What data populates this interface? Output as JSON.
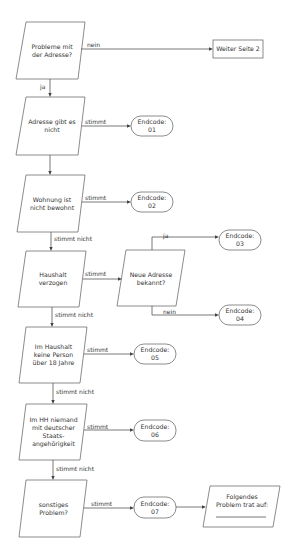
{
  "flowchart": {
    "decisions": [
      {
        "id": "d1",
        "lines": [
          "Probleme mit",
          "der Adresse?"
        ]
      },
      {
        "id": "d2",
        "lines": [
          "Adresse gibt es",
          "nicht"
        ]
      },
      {
        "id": "d3",
        "lines": [
          "Wohnung ist",
          "nicht bewohnt"
        ]
      },
      {
        "id": "d4",
        "lines": [
          "Haushalt",
          "verzogen"
        ]
      },
      {
        "id": "d5",
        "lines": [
          "Neue Adresse",
          "bekannt?"
        ]
      },
      {
        "id": "d6",
        "lines": [
          "Im Haushalt",
          "keine Person",
          "über 18 Jahre"
        ]
      },
      {
        "id": "d7",
        "lines": [
          "Im HH niemand",
          "mit deutscher",
          "Staats-",
          "angehörigkeit"
        ]
      },
      {
        "id": "d8",
        "lines": [
          "sonstiges",
          "Problem?"
        ]
      }
    ],
    "process": {
      "label": "Weiter Seite 2"
    },
    "endcodes": [
      {
        "label": "Endcode:",
        "code": "01"
      },
      {
        "label": "Endcode:",
        "code": "02"
      },
      {
        "label": "Endcode:",
        "code": "03"
      },
      {
        "label": "Endcode:",
        "code": "04"
      },
      {
        "label": "Endcode:",
        "code": "05"
      },
      {
        "label": "Endcode:",
        "code": "06"
      },
      {
        "label": "Endcode:",
        "code": "07"
      }
    ],
    "output": {
      "lines": [
        "Folgendes",
        "Problem trat auf:"
      ],
      "blank": "____________"
    },
    "edge_labels": {
      "nein": "nein",
      "ja": "ja",
      "stimmt": "stimmt",
      "stimmt_nicht": "stimmt nicht"
    },
    "colors": {
      "stroke": "#6e6e6e",
      "line": "#555555",
      "text": "#333333",
      "background": "#ffffff"
    }
  }
}
